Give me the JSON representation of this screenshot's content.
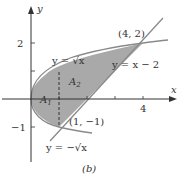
{
  "figure": {
    "caption": "(b)",
    "axes": {
      "x_label": "x",
      "y_label": "y",
      "x_ticks": [
        {
          "value": 4,
          "label": "4"
        }
      ],
      "y_ticks": [
        {
          "value": 2,
          "label": "2"
        },
        {
          "value": -1,
          "label": "−1"
        }
      ]
    },
    "curves": [
      {
        "name": "upper-root",
        "label": "y = √x"
      },
      {
        "name": "line",
        "label": "y = x − 2"
      },
      {
        "name": "lower-root",
        "label": "y = −√x"
      }
    ],
    "points": [
      {
        "label": "(4, 2)",
        "x": 4,
        "y": 2
      },
      {
        "label": "(1, −1)",
        "x": 1,
        "y": -1
      }
    ],
    "regions": [
      {
        "label": "A",
        "subscript": "1"
      },
      {
        "label": "A",
        "subscript": "2"
      }
    ],
    "colors": {
      "shade": "#a9a9a9",
      "curve": "#8a8a8a",
      "axis": "#333333"
    }
  }
}
